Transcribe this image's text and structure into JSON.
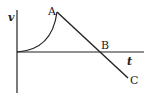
{
  "diagram": {
    "axes": {
      "vertical_label": "v",
      "horizontal_label": "t"
    },
    "points": [
      {
        "label": "A"
      },
      {
        "label": "B"
      },
      {
        "label": "C"
      }
    ],
    "stroke_color": "#222222",
    "background": "#ffffff"
  }
}
